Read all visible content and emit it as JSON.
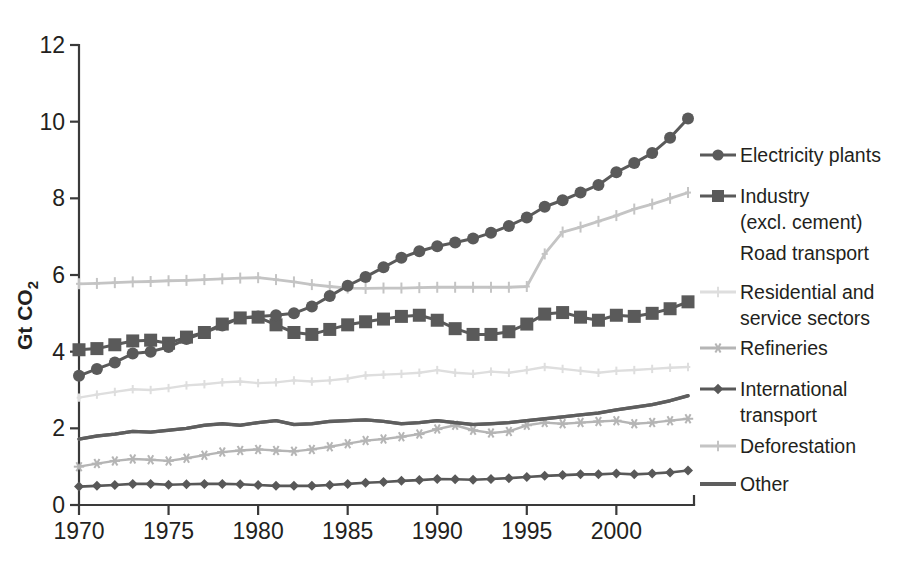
{
  "chart_data": {
    "type": "line",
    "title": "",
    "xlabel": "",
    "ylabel": "Gt CO2",
    "ylabel_main": "Gt CO",
    "ylabel_subscript": "2",
    "xlim": [
      1969.4,
      2004.2
    ],
    "ylim": [
      0,
      12
    ],
    "ytick_labels": [
      "0",
      "2",
      "4",
      "6",
      "8",
      "10",
      "12"
    ],
    "ytick_values": [
      0,
      2,
      4,
      6,
      8,
      10,
      12
    ],
    "xtick_labels": [
      "1970",
      "1975",
      "1980",
      "1985",
      "1990",
      "1995",
      "2000"
    ],
    "xtick_values": [
      1970,
      1975,
      1980,
      1985,
      1990,
      1995,
      2000
    ],
    "grid": false,
    "legend_position": "right",
    "x": [
      1970,
      1971,
      1972,
      1973,
      1974,
      1975,
      1976,
      1977,
      1978,
      1979,
      1980,
      1981,
      1982,
      1983,
      1984,
      1985,
      1986,
      1987,
      1988,
      1989,
      1990,
      1991,
      1992,
      1993,
      1994,
      1995,
      1996,
      1997,
      1998,
      1999,
      2000,
      2001,
      2002,
      2003,
      2004
    ],
    "series": [
      {
        "name": "Electricity plants",
        "color": "#5a5a5a",
        "marker": "circle",
        "line_width": 3.0,
        "marker_size": 6.0,
        "values": [
          3.37,
          3.55,
          3.72,
          3.95,
          4.0,
          4.12,
          4.33,
          4.5,
          4.68,
          4.88,
          4.92,
          4.95,
          5.0,
          5.18,
          5.45,
          5.72,
          5.95,
          6.2,
          6.45,
          6.62,
          6.75,
          6.85,
          6.95,
          7.1,
          7.28,
          7.5,
          7.78,
          7.95,
          8.15,
          8.35,
          8.68,
          8.92,
          9.18,
          9.58,
          10.08
        ]
      },
      {
        "name": "Industry (excl. cement)",
        "label_line1": "Industry",
        "label_line2": "(excl. cement)",
        "color": "#5a5a5a",
        "marker": "square",
        "line_width": 3.0,
        "marker_size": 6.5,
        "values": [
          4.05,
          4.08,
          4.18,
          4.28,
          4.3,
          4.22,
          4.38,
          4.5,
          4.72,
          4.88,
          4.9,
          4.7,
          4.5,
          4.45,
          4.58,
          4.7,
          4.78,
          4.85,
          4.92,
          4.95,
          4.82,
          4.6,
          4.45,
          4.45,
          4.52,
          4.72,
          4.98,
          5.02,
          4.9,
          4.82,
          4.95,
          4.92,
          5.0,
          5.12,
          5.3
        ]
      },
      {
        "name": "Road transport",
        "color": "#6e6e6e",
        "marker": "none",
        "line_width": 3.2,
        "marker_size": 0,
        "values": [
          1.72,
          1.8,
          1.85,
          1.92,
          1.9,
          1.95,
          2.0,
          2.08,
          2.12,
          2.08,
          2.15,
          2.2,
          2.1,
          2.12,
          2.18,
          2.2,
          2.22,
          2.18,
          2.12,
          2.15,
          2.2,
          2.15,
          2.1,
          2.12,
          2.15,
          2.2,
          2.25,
          2.3,
          2.35,
          2.4,
          2.48,
          2.55,
          2.62,
          2.72,
          2.85
        ]
      },
      {
        "name": "Residential and service sectors",
        "label_line1": "Residential and",
        "label_line2": "service sectors",
        "color": "#dedede",
        "marker": "plus",
        "line_width": 2.4,
        "marker_size": 4.2,
        "values": [
          2.8,
          2.88,
          2.95,
          3.02,
          3.0,
          3.05,
          3.12,
          3.15,
          3.2,
          3.22,
          3.18,
          3.2,
          3.25,
          3.22,
          3.25,
          3.3,
          3.38,
          3.4,
          3.42,
          3.45,
          3.52,
          3.45,
          3.42,
          3.48,
          3.45,
          3.52,
          3.6,
          3.55,
          3.5,
          3.45,
          3.5,
          3.52,
          3.55,
          3.58,
          3.6
        ]
      },
      {
        "name": "Refineries",
        "color": "#b5b5b5",
        "marker": "asterisk",
        "line_width": 2.4,
        "marker_size": 5.2,
        "values": [
          1.0,
          1.08,
          1.15,
          1.2,
          1.18,
          1.15,
          1.22,
          1.3,
          1.38,
          1.42,
          1.45,
          1.42,
          1.4,
          1.45,
          1.52,
          1.6,
          1.68,
          1.72,
          1.78,
          1.85,
          1.98,
          2.08,
          1.95,
          1.88,
          1.92,
          2.08,
          2.15,
          2.12,
          2.15,
          2.18,
          2.2,
          2.12,
          2.15,
          2.2,
          2.25
        ]
      },
      {
        "name": "International transport",
        "label_line1": "International",
        "label_line2": "transport",
        "color": "#585858",
        "marker": "diamond",
        "line_width": 2.6,
        "marker_size": 5.0,
        "values": [
          0.48,
          0.5,
          0.52,
          0.55,
          0.55,
          0.53,
          0.54,
          0.55,
          0.55,
          0.54,
          0.52,
          0.5,
          0.5,
          0.5,
          0.52,
          0.55,
          0.58,
          0.6,
          0.63,
          0.65,
          0.68,
          0.67,
          0.66,
          0.68,
          0.7,
          0.73,
          0.76,
          0.78,
          0.8,
          0.8,
          0.82,
          0.8,
          0.82,
          0.85,
          0.9
        ]
      },
      {
        "name": "Deforestation",
        "color": "#c4c4c4",
        "marker": "plus",
        "line_width": 2.8,
        "marker_size": 5.5,
        "values": [
          5.77,
          5.78,
          5.8,
          5.82,
          5.83,
          5.85,
          5.86,
          5.88,
          5.9,
          5.92,
          5.93,
          5.88,
          5.82,
          5.75,
          5.7,
          5.66,
          5.65,
          5.66,
          5.66,
          5.67,
          5.68,
          5.68,
          5.68,
          5.68,
          5.68,
          5.7,
          6.55,
          7.12,
          7.25,
          7.4,
          7.55,
          7.72,
          7.85,
          8.0,
          8.15
        ]
      },
      {
        "name": "Other",
        "color": "#5e5e5e",
        "marker": "none",
        "line_width": 3.4,
        "marker_size": 0,
        "values": [
          1.72,
          1.8,
          1.85,
          1.92,
          1.9,
          1.95,
          2.0,
          2.08,
          2.12,
          2.08,
          2.15,
          2.2,
          2.1,
          2.12,
          2.18,
          2.2,
          2.22,
          2.18,
          2.12,
          2.15,
          2.2,
          2.15,
          2.1,
          2.12,
          2.15,
          2.2,
          2.25,
          2.3,
          2.35,
          2.4,
          2.48,
          2.55,
          2.62,
          2.72,
          2.85
        ]
      }
    ]
  },
  "legend": {
    "entries": [
      {
        "label": "Electricity plants",
        "color": "#5a5a5a",
        "marker": "circle",
        "show_sample": true
      },
      {
        "label": "Industry",
        "label2": "(excl. cement)",
        "color": "#5a5a5a",
        "marker": "square",
        "show_sample": true
      },
      {
        "label": "Road transport",
        "color": "#6e6e6e",
        "marker": "none",
        "show_sample": false
      },
      {
        "label": "Residential and",
        "label2": "service sectors",
        "color": "#dedede",
        "marker": "plus",
        "show_sample": true
      },
      {
        "label": "Refineries",
        "color": "#b5b5b5",
        "marker": "asterisk",
        "show_sample": true
      },
      {
        "label": "International",
        "label2": "transport",
        "color": "#585858",
        "marker": "diamond",
        "show_sample": true
      },
      {
        "label": "Deforestation",
        "color": "#c4c4c4",
        "marker": "plus",
        "show_sample": true
      },
      {
        "label": "Other",
        "color": "#5e5e5e",
        "marker": "none",
        "show_sample": true
      }
    ]
  },
  "axes": {
    "y_label_main": "Gt CO",
    "y_label_sub": "2",
    "axis_color": "#3a3a3a"
  }
}
